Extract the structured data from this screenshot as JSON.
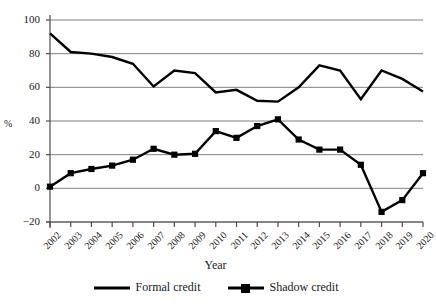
{
  "chart_data": {
    "type": "line",
    "title": "",
    "xlabel": "Year",
    "ylabel": "%",
    "categories": [
      "2002",
      "2003",
      "2004",
      "2005",
      "2006",
      "2007",
      "2008",
      "2009",
      "2010",
      "2011",
      "2012",
      "2013",
      "2014",
      "2015",
      "2016",
      "2017",
      "2018",
      "2019",
      "2020"
    ],
    "yticks": [
      100,
      80,
      60,
      40,
      20,
      0,
      -20
    ],
    "ylim": [
      -20,
      100
    ],
    "grid": "horizontal",
    "legend_position": "bottom",
    "series": [
      {
        "name": "Formal credit",
        "marker": "none",
        "color": "#000000",
        "values": [
          92,
          81,
          80,
          78,
          74,
          60.5,
          70,
          68.5,
          57,
          58.5,
          52,
          51.5,
          60,
          73,
          70,
          53,
          70,
          65,
          57.5
        ]
      },
      {
        "name": "Shadow credit",
        "marker": "square",
        "color": "#000000",
        "values": [
          1,
          9,
          11.5,
          13.5,
          17,
          23.5,
          20,
          20.5,
          34,
          30,
          37,
          41,
          29,
          23,
          23,
          14,
          -14,
          -7,
          9
        ]
      }
    ]
  },
  "axis": {
    "y_title": "%",
    "x_title": "Year",
    "y_tick_labels": [
      "100",
      "80",
      "60",
      "40",
      "20",
      "0",
      "−20"
    ],
    "x_tick_labels": [
      "2002",
      "2003",
      "2004",
      "2005",
      "2006",
      "2007",
      "2008",
      "2009",
      "2010",
      "2011",
      "2012",
      "2013",
      "2014",
      "2015",
      "2016",
      "2017",
      "2018",
      "2019",
      "2020"
    ]
  },
  "legend": {
    "items": [
      {
        "label": "Formal credit",
        "marker": "line"
      },
      {
        "label": "Shadow credit",
        "marker": "line-square"
      }
    ]
  },
  "colors": {
    "series": "#000000",
    "grid": "#808080",
    "axis": "#4d4d4d",
    "background": "#ffffff"
  }
}
